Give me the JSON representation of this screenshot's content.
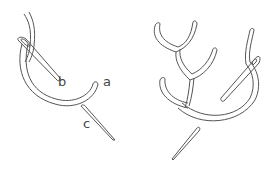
{
  "diagram": {
    "type": "embroidery-stitch-illustration",
    "panels": [
      {
        "id": "left",
        "description": "Single stitch loop with needle",
        "labels": [
          {
            "id": "a",
            "text": "a"
          },
          {
            "id": "b",
            "text": "b"
          },
          {
            "id": "c",
            "text": "c"
          }
        ]
      },
      {
        "id": "right",
        "description": "Chain of Y-shaped (fly/feather) stitches with needle"
      }
    ],
    "colors": {
      "line": "#555555",
      "background": "#ffffff",
      "text": "#444444"
    }
  }
}
